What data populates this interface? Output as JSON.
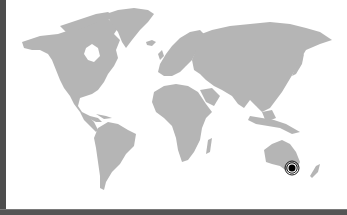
{
  "map": {
    "type": "world-map",
    "land_color": "#b5b5b5",
    "background_color": "#ffffff",
    "border_color": "#4d4d4d",
    "regions": [
      "North America",
      "Greenland",
      "South America",
      "Europe",
      "Africa",
      "Asia",
      "Australia",
      "New Zealand"
    ],
    "marker": {
      "icon": "location-target-icon",
      "region": "Australia (south-east)",
      "x": 292,
      "y": 168,
      "color": "#000000"
    }
  }
}
